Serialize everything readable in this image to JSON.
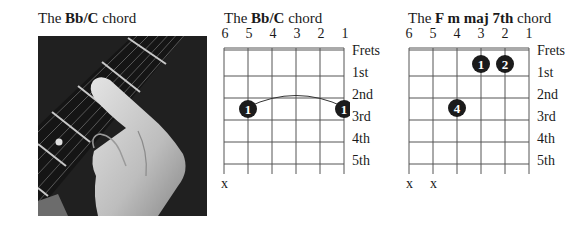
{
  "photo_section": {
    "title_prefix": "The ",
    "title_bold": "Bb/C",
    "title_suffix": " chord"
  },
  "diagram1": {
    "title_prefix": "The ",
    "title_bold": "Bb/C",
    "title_suffix": " chord",
    "string_numbers": [
      "6",
      "5",
      "4",
      "3",
      "2",
      "1"
    ],
    "fret_labels": [
      "Frets",
      "1st",
      "2nd",
      "3rd",
      "4th",
      "5th"
    ],
    "muted": [
      "x"
    ],
    "fingers": [
      {
        "finger": "1",
        "string": 5,
        "fret": 3
      },
      {
        "finger": "1",
        "string": 1,
        "fret": 3
      }
    ],
    "barre": "string 5 to string 1 at 3rd fret"
  },
  "diagram2": {
    "title_prefix": "The ",
    "title_bold": "F m maj 7th",
    "title_suffix": " chord",
    "string_numbers": [
      "6",
      "5",
      "4",
      "3",
      "2",
      "1"
    ],
    "fret_labels": [
      "Frets",
      "1st",
      "2nd",
      "3rd",
      "4th",
      "5th"
    ],
    "muted": [
      "x",
      "x"
    ],
    "fingers": [
      {
        "finger": "1",
        "string": 3,
        "fret": 1
      },
      {
        "finger": "2",
        "string": 2,
        "fret": 1
      },
      {
        "finger": "4",
        "string": 4,
        "fret": 3
      }
    ]
  },
  "colors": {
    "ink": "#1a1a1a",
    "dot": "#1b1b1b",
    "grid": "#555555"
  }
}
